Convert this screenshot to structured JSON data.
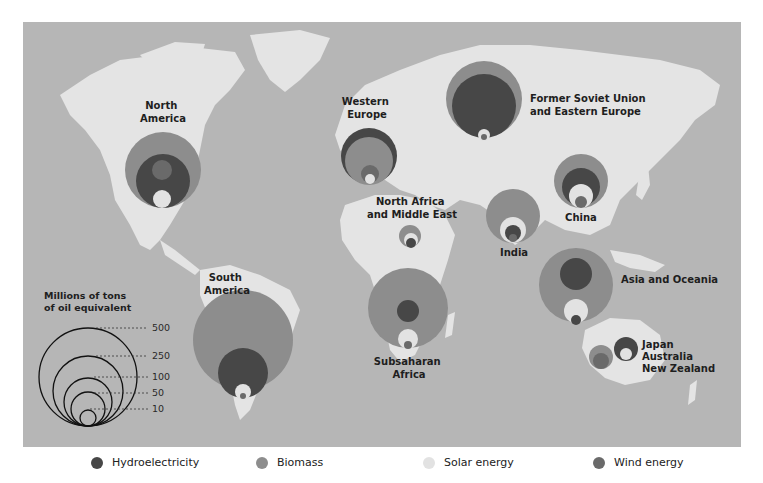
{
  "colors": {
    "ocean": "#b6b6b6",
    "land": "#e4e4e4",
    "hydroelectricity": "#474747",
    "biomass": "#8d8d8d",
    "solar": "#e2e2e2",
    "wind": "#6a6a6a"
  },
  "scale": {
    "title_line1": "Millions of tons",
    "title_line2": "of oil equivalent",
    "values": [
      "500",
      "250",
      "100",
      "50",
      "10"
    ]
  },
  "regions": [
    {
      "name": "north-america",
      "label_lines": [
        "North",
        "America"
      ]
    },
    {
      "name": "western-europe",
      "label_lines": [
        "Western",
        "Europe"
      ]
    },
    {
      "name": "former-soviet-union",
      "label_lines": [
        "Former Soviet Union",
        "and Eastern Europe"
      ]
    },
    {
      "name": "north-africa-middle-east",
      "label_lines": [
        "North Africa",
        "and Middle East"
      ]
    },
    {
      "name": "india",
      "label_lines": [
        "India"
      ]
    },
    {
      "name": "china",
      "label_lines": [
        "China"
      ]
    },
    {
      "name": "asia-oceania",
      "label_lines": [
        "Asia and Oceania"
      ]
    },
    {
      "name": "japan-australia-nz",
      "label_lines": [
        "Japan",
        "Australia",
        "New Zealand"
      ]
    },
    {
      "name": "south-america",
      "label_lines": [
        "South",
        "America"
      ]
    },
    {
      "name": "subsaharan-africa",
      "label_lines": [
        "Subsaharan",
        "Africa"
      ]
    }
  ],
  "legend": [
    {
      "label": "Hydroelectricity",
      "color": "#474747"
    },
    {
      "label": "Biomass",
      "color": "#8d8d8d"
    },
    {
      "label": "Solar energy",
      "color": "#e2e2e2"
    },
    {
      "label": "Wind energy",
      "color": "#6a6a6a"
    }
  ]
}
